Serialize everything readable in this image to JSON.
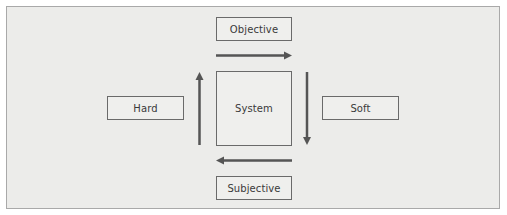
{
  "diagram": {
    "colors": {
      "background": "#ececea",
      "frame_border": "#a9a9a9",
      "box_border": "#6a6a6a",
      "arrow": "#555555",
      "text": "#3a3a3a"
    },
    "nodes": {
      "objective": "Objective",
      "system": "System",
      "hard": "Hard",
      "soft": "Soft",
      "subjective": "Subjective"
    },
    "arrows": [
      {
        "position": "top",
        "direction": "right"
      },
      {
        "position": "right",
        "direction": "down"
      },
      {
        "position": "bottom",
        "direction": "left"
      },
      {
        "position": "left",
        "direction": "up"
      }
    ]
  }
}
